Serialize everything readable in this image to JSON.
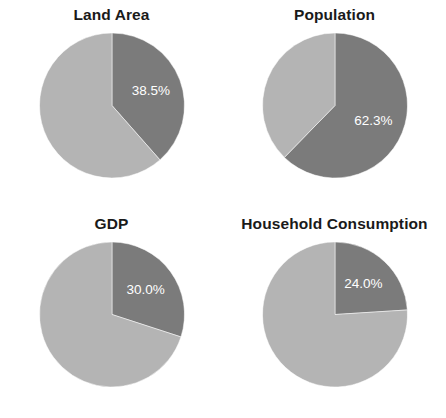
{
  "figure": {
    "background_color": "#ffffff",
    "title_color": "#1a1a1a",
    "label_color": "#ffffff"
  },
  "chart_data": [
    {
      "type": "pie",
      "title": "Land Area",
      "categories": [
        "Share",
        "Remainder"
      ],
      "values": [
        38.5,
        61.5
      ],
      "colors": [
        "#7b7b7b",
        "#b4b4b4"
      ],
      "labels": [
        "38.5%",
        ""
      ],
      "startangle": 90,
      "counterclock": false,
      "legend": "none",
      "grid": false
    },
    {
      "type": "pie",
      "title": "Population",
      "categories": [
        "Share",
        "Remainder"
      ],
      "values": [
        62.3,
        37.7
      ],
      "colors": [
        "#7b7b7b",
        "#b4b4b4"
      ],
      "labels": [
        "62.3%",
        ""
      ],
      "startangle": 90,
      "counterclock": false,
      "legend": "none",
      "grid": false
    },
    {
      "type": "pie",
      "title": "GDP",
      "categories": [
        "Share",
        "Remainder"
      ],
      "values": [
        30.0,
        70.0
      ],
      "colors": [
        "#7b7b7b",
        "#b4b4b4"
      ],
      "labels": [
        "30.0%",
        ""
      ],
      "startangle": 90,
      "counterclock": false,
      "legend": "none",
      "grid": false
    },
    {
      "type": "pie",
      "title": "Household Consumption",
      "categories": [
        "Share",
        "Remainder"
      ],
      "values": [
        24.0,
        76.0
      ],
      "colors": [
        "#7b7b7b",
        "#b4b4b4"
      ],
      "labels": [
        "24.0%",
        ""
      ],
      "startangle": 90,
      "counterclock": false,
      "legend": "none",
      "grid": false
    }
  ]
}
